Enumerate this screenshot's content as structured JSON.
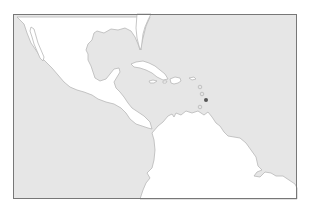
{
  "map": {
    "region": "Caribbean and Central America",
    "colors": {
      "water": "#e6e6e6",
      "land": "#ffffff",
      "coastline": "#b8b8b8",
      "frame": "#777777",
      "highlight": "#555555"
    },
    "highlighted_location": {
      "label": "",
      "x": 206,
      "y": 100
    },
    "markers": [
      {
        "x": 200,
        "y": 87
      },
      {
        "x": 202,
        "y": 94
      },
      {
        "x": 200,
        "y": 107
      }
    ]
  }
}
